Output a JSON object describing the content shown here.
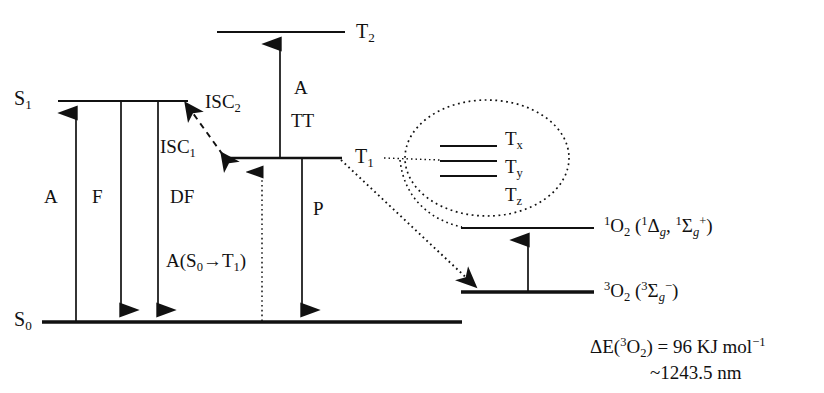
{
  "diagram": {
    "colors": {
      "ink": "#111111",
      "background": "#ffffff"
    },
    "states": {
      "s0": "S₀",
      "s1": "S₁",
      "t1": "T₁",
      "t2": "T₂",
      "tx": "Tₓ",
      "ty": "Tᵧ",
      "tz": "Tᶻ"
    },
    "state_labels": {
      "s0_html": "S<sub>0</sub>",
      "s1_html": "S<sub>1</sub>",
      "t1_html": "T<sub>1</sub>",
      "t2_html": "T<sub>2</sub>",
      "tx_html": "T<sub>x</sub>",
      "ty_html": "T<sub>y</sub>",
      "tz_html": "T<sub>z</sub>"
    },
    "processes": {
      "absorption": "A",
      "fluorescence": "F",
      "delayed_fluorescence": "DF",
      "phosphorescence": "P",
      "triplet_triplet_absorption_a": "A",
      "triplet_triplet_absorption_tt": "TT",
      "intersystem_crossing_1": "ISC₁",
      "intersystem_crossing_2": "ISC₂",
      "singlet_triplet_absorption": "A(S₀→T₁)"
    },
    "process_labels_html": {
      "absorption_html": "A",
      "fluorescence_html": "F",
      "delayed_fluorescence_html": "DF",
      "phosphorescence_html": "P",
      "tt_a_html": "A",
      "tt_html": "TT",
      "isc1_html": "ISC<sub>1</sub>",
      "isc2_html": "ISC<sub>2</sub>",
      "s0_to_t1_html": "A(S<sub>0</sub>→T<sub>1</sub>)"
    },
    "oxygen": {
      "singlet_label": "¹O₂ (¹Δg, ¹Σg⁺)",
      "singlet_label_html": "<sup>1</sup>O<sub>2</sub> (<sup>1</sup>Δ<sub class=\"ital\">g</sub>, <sup>1</sup>Σ<sub class=\"ital\">g</sub><sup>+</sup>)",
      "triplet_label": "³O₂ (³Σg⁻)",
      "triplet_label_html": "<sup>3</sup>O<sub>2</sub> (<sup>3</sup>Σ<sub class=\"ital\">g</sub><sup>−</sup>)"
    },
    "energy_note": {
      "line1": "ΔE(³O₂) = 96 KJ mol⁻¹",
      "line1_html": "ΔE(<sup>3</sup>O<sub>2</sub>) = 96 KJ mol<sup>−1</sup>",
      "line2": "~1243.5 nm",
      "line2_html": "~1243.5 nm",
      "value": 96,
      "units": "KJ mol⁻¹",
      "wavelength_nm": 1243.5
    }
  }
}
